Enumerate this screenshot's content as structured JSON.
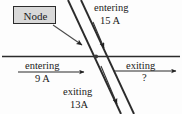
{
  "figure": {
    "background_color": "#fdfdfd",
    "line_color": "#2b2b2b",
    "node_box_fill": "#d9d9d9"
  },
  "callout": {
    "label": "Node"
  },
  "branches": {
    "top": {
      "direction_label": "entering",
      "value_label": "15 A",
      "current_amps": 15,
      "sense": "entering"
    },
    "left": {
      "direction_label": "entering",
      "value_label": "9 A",
      "current_amps": 9,
      "sense": "entering"
    },
    "right": {
      "direction_label": "exiting",
      "value_label": "?",
      "current_amps": null,
      "sense": "exiting"
    },
    "bottom": {
      "direction_label": "exiting",
      "value_label": "13A",
      "current_amps": 13,
      "sense": "exiting"
    }
  },
  "icons": {
    "arrowhead": "arrowhead-icon",
    "leader_arrow": "leader-arrow-icon",
    "junction": "junction-dot-icon"
  }
}
